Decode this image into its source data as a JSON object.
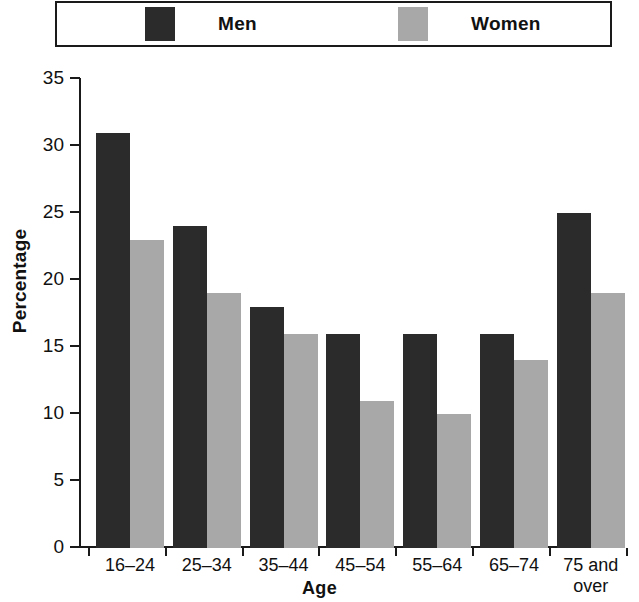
{
  "legend": {
    "entries": [
      {
        "label": "Men",
        "icon": "legend-swatch-men",
        "color": "#2b2b2b"
      },
      {
        "label": "Women",
        "icon": "legend-swatch-women",
        "color": "#a8a8a8"
      }
    ]
  },
  "chart_data": {
    "type": "bar",
    "title": "",
    "xlabel": "Age",
    "ylabel": "Percentage",
    "categories": [
      "16–24",
      "25–34",
      "35–44",
      "45–54",
      "55–64",
      "65–74",
      "75 and\nover"
    ],
    "series": [
      {
        "name": "Men",
        "color": "#2b2b2b",
        "values": [
          31,
          24,
          18,
          16,
          16,
          16,
          25
        ]
      },
      {
        "name": "Women",
        "color": "#a8a8a8",
        "values": [
          23,
          19,
          16,
          11,
          10,
          14,
          19
        ]
      }
    ],
    "ylim": [
      0,
      35
    ],
    "yticks": [
      0,
      5,
      10,
      15,
      20,
      25,
      30,
      35
    ],
    "ytick_labels": [
      "0",
      "5",
      "10",
      "15",
      "20",
      "25",
      "30",
      "35"
    ],
    "grid": false,
    "legend_position": "top"
  }
}
